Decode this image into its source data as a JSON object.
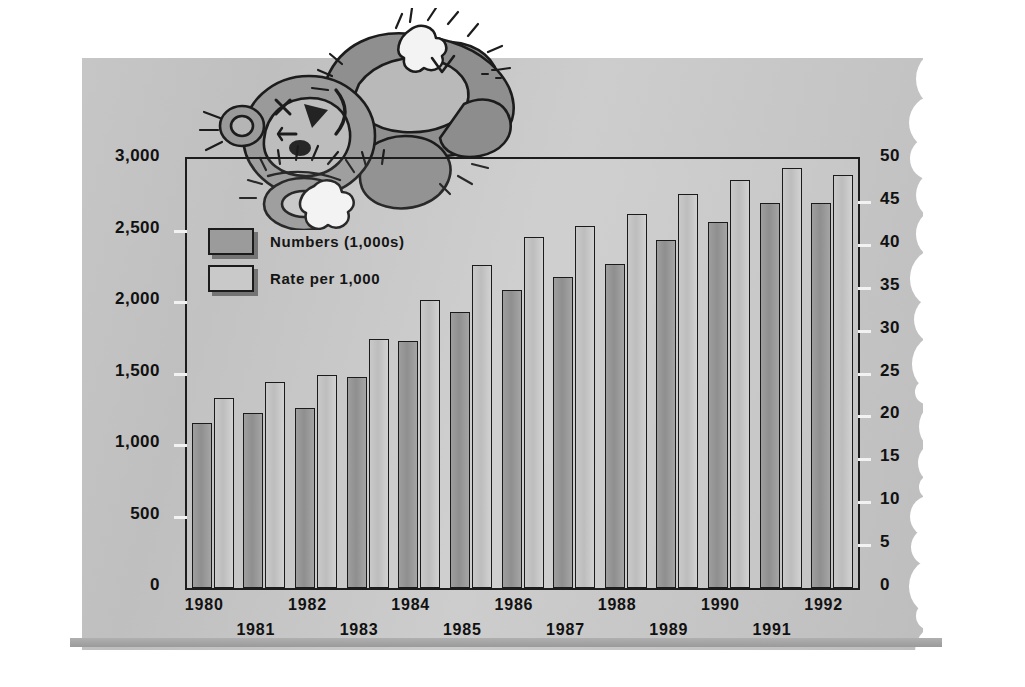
{
  "chart_data": {
    "type": "bar",
    "title": "",
    "subtitle": "",
    "xlabel": "",
    "ylabel": "Numbers (1,000s)",
    "y2label": "Rate per 1,000",
    "grid": false,
    "legend_position": "inside-top-left",
    "categories": [
      "1980",
      "1981",
      "1982",
      "1983",
      "1984",
      "1985",
      "1986",
      "1987",
      "1988",
      "1989",
      "1990",
      "1991",
      "1992"
    ],
    "ylim": [
      0,
      3000
    ],
    "yticks": [
      0,
      500,
      1000,
      1500,
      2000,
      2500,
      3000
    ],
    "ytick_labels": [
      "0",
      "500",
      "1,000",
      "1,500",
      "2,000",
      "2,500",
      "3,000"
    ],
    "y2lim": [
      0,
      50
    ],
    "y2ticks": [
      0,
      5,
      10,
      15,
      20,
      25,
      30,
      35,
      40,
      45,
      50
    ],
    "y2tick_labels": [
      "0",
      "5",
      "10",
      "15",
      "20",
      "25",
      "30",
      "35",
      "40",
      "45",
      "50"
    ],
    "series": [
      {
        "name": "Numbers (1,000s)",
        "axis": "left",
        "color": "#9b9b9b",
        "values": [
          1154,
          1226,
          1262,
          1477,
          1727,
          1928,
          2086,
          2178,
          2265,
          2435,
          2557,
          2694,
          2690
        ]
      },
      {
        "name": "Rate per 1,000",
        "axis": "right",
        "color": "#c9c9c9",
        "values": [
          22.2,
          24.0,
          24.8,
          29.0,
          33.6,
          37.6,
          40.9,
          42.2,
          43.6,
          45.9,
          47.6,
          48.9,
          48.1
        ]
      }
    ]
  },
  "legend": {
    "items": [
      {
        "label": "Numbers (1,000s)",
        "swatch": "num"
      },
      {
        "label": "Rate per 1,000",
        "swatch": "rate"
      }
    ]
  },
  "decoration": {
    "illustration_name": "worn-teddy-bear-lying-down",
    "paper_style": "torn-edge-paper"
  },
  "colors": {
    "paper": "#c6c6c6",
    "axis": "#1d1d1d",
    "bar_numbers": "#9b9b9b",
    "bar_rate": "#c9c9c9",
    "bar_shadow": "#8d8d8d",
    "text": "#111111",
    "bear_dark": "#8a8a8a",
    "bear_mid": "#a3a3a3",
    "bear_light": "#c4c4c4"
  }
}
